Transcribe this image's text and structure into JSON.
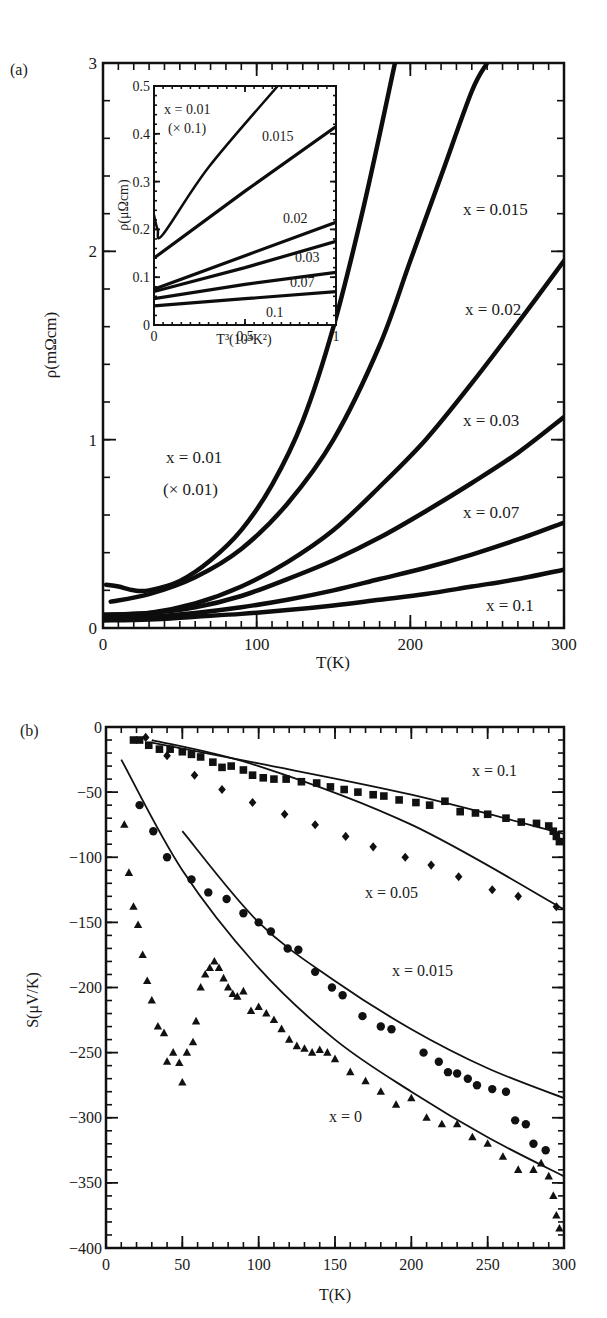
{
  "chart_data": [
    {
      "panel": "(a)",
      "type": "line",
      "title": "",
      "xlabel": "T(K)",
      "ylabel": "ρ(mΩcm)",
      "xlim": [
        0,
        300
      ],
      "ylim": [
        0,
        3
      ],
      "xticks": [
        0,
        100,
        200,
        300
      ],
      "yticks": [
        0,
        1,
        2,
        3
      ],
      "grid": false,
      "legend": "inline labels",
      "series": [
        {
          "name": "x=0.01 (× 0.01)",
          "x": [
            2,
            10,
            20,
            30,
            50,
            70,
            90,
            110,
            130,
            150,
            170,
            190
          ],
          "values": [
            0.23,
            0.22,
            0.2,
            0.2,
            0.25,
            0.36,
            0.52,
            0.76,
            1.1,
            1.6,
            2.25,
            3.0
          ]
        },
        {
          "name": "x=0.015",
          "x": [
            5,
            30,
            60,
            90,
            120,
            150,
            180,
            200,
            220,
            240,
            250
          ],
          "values": [
            0.14,
            0.18,
            0.27,
            0.42,
            0.66,
            1.0,
            1.5,
            1.95,
            2.4,
            2.85,
            3.0
          ]
        },
        {
          "name": "x=0.02",
          "x": [
            0,
            30,
            60,
            90,
            120,
            150,
            180,
            210,
            240,
            270,
            300
          ],
          "values": [
            0.07,
            0.08,
            0.13,
            0.22,
            0.35,
            0.52,
            0.75,
            1.0,
            1.3,
            1.62,
            1.95
          ]
        },
        {
          "name": "x=0.03",
          "x": [
            0,
            30,
            60,
            90,
            120,
            150,
            180,
            210,
            240,
            270,
            300
          ],
          "values": [
            0.07,
            0.08,
            0.11,
            0.17,
            0.26,
            0.36,
            0.48,
            0.62,
            0.77,
            0.93,
            1.12
          ]
        },
        {
          "name": "x=0.07",
          "x": [
            0,
            30,
            60,
            90,
            120,
            150,
            180,
            210,
            240,
            270,
            300
          ],
          "values": [
            0.05,
            0.06,
            0.08,
            0.11,
            0.15,
            0.2,
            0.26,
            0.32,
            0.39,
            0.47,
            0.56
          ]
        },
        {
          "name": "x=0.1",
          "x": [
            0,
            30,
            60,
            90,
            120,
            150,
            180,
            210,
            240,
            270,
            300
          ],
          "values": [
            0.04,
            0.045,
            0.06,
            0.075,
            0.095,
            0.12,
            0.15,
            0.18,
            0.22,
            0.26,
            0.31
          ]
        }
      ],
      "annotations": [
        "x=0.015",
        "x=0.02",
        "x=0.03",
        "x=0.07",
        "x=0.1",
        "x=0.01",
        "(× 0.01)"
      ],
      "inset": {
        "type": "line",
        "xlabel": "T³(10⁴K²)",
        "ylabel": "ρ(μΩcm)",
        "xlim": [
          0,
          1
        ],
        "ylim": [
          0,
          0.5
        ],
        "xticks": [
          0,
          0.5,
          1
        ],
        "yticks": [
          0,
          0.1,
          0.2,
          0.3,
          0.4,
          0.5
        ],
        "series": [
          {
            "name": "x=0.01 (× 0.1)",
            "x": [
              0,
              0.02,
              0.05,
              0.3,
              0.68
            ],
            "values": [
              0.23,
              0.2,
              0.19,
              0.33,
              0.5
            ]
          },
          {
            "name": "0.015",
            "x": [
              0,
              0.5,
              1
            ],
            "values": [
              0.14,
              0.28,
              0.415
            ]
          },
          {
            "name": "0.02",
            "x": [
              0,
              0.5,
              1
            ],
            "values": [
              0.075,
              0.145,
              0.215
            ]
          },
          {
            "name": "0.03",
            "x": [
              0,
              0.5,
              1
            ],
            "values": [
              0.07,
              0.12,
              0.175
            ]
          },
          {
            "name": "0.07",
            "x": [
              0,
              0.5,
              1
            ],
            "values": [
              0.055,
              0.085,
              0.11
            ]
          },
          {
            "name": "0.1",
            "x": [
              0,
              0.5,
              1
            ],
            "values": [
              0.04,
              0.055,
              0.07
            ]
          }
        ],
        "annotations": [
          "x=0.01",
          "(× 0.1)",
          "0.015",
          "0.02",
          "0.03",
          "0.07",
          "0.1"
        ]
      }
    },
    {
      "panel": "(b)",
      "type": "scatter",
      "title": "",
      "xlabel": "T(K)",
      "ylabel": "S(μV/K)",
      "xlim": [
        0,
        300
      ],
      "ylim": [
        -400,
        0
      ],
      "xticks": [
        0,
        50,
        100,
        150,
        200,
        250,
        300
      ],
      "yticks": [
        0,
        -50,
        -100,
        -150,
        -200,
        -250,
        -300,
        -350,
        -400
      ],
      "grid": false,
      "legend": "inline labels",
      "series": [
        {
          "name": "x=0.1",
          "marker": "square",
          "x": [
            18,
            22,
            28,
            35,
            42,
            50,
            56,
            62,
            70,
            76,
            82,
            90,
            96,
            103,
            110,
            118,
            128,
            138,
            147,
            156,
            165,
            175,
            182,
            192,
            203,
            212,
            222,
            232,
            242,
            250,
            262,
            272,
            282,
            290,
            293,
            295,
            297
          ],
          "values": [
            -10,
            -10,
            -14,
            -17,
            -17,
            -19,
            -21,
            -23,
            -27,
            -31,
            -30,
            -33,
            -37,
            -39,
            -40,
            -40,
            -42,
            -43,
            -46,
            -48,
            -50,
            -52,
            -53,
            -56,
            -58,
            -60,
            -57,
            -65,
            -66,
            -67,
            -70,
            -73,
            -74,
            -76,
            -80,
            -84,
            -88
          ]
        },
        {
          "name": "x=0.05",
          "marker": "diamond",
          "fit_x": [
            30,
            100,
            200,
            300
          ],
          "fit_values": [
            -10,
            -30,
            -75,
            -140
          ],
          "x": [
            26,
            40,
            58,
            76,
            96,
            117,
            137,
            157,
            175,
            196,
            213,
            231,
            253,
            270,
            295
          ],
          "values": [
            -8,
            -22,
            -37,
            -48,
            -58,
            -67,
            -75,
            -84,
            -92,
            -100,
            -106,
            -115,
            -125,
            -130,
            -138
          ]
        },
        {
          "name": "x=0.015",
          "marker": "circle",
          "fit_x": [
            50,
            100,
            150,
            200,
            250,
            300
          ],
          "fit_values": [
            -80,
            -150,
            -195,
            -232,
            -262,
            -285
          ],
          "x": [
            22,
            31,
            40,
            56,
            67,
            79,
            90,
            100,
            108,
            119,
            126,
            137,
            148,
            155,
            168,
            180,
            187,
            208,
            218,
            224,
            230,
            237,
            243,
            253,
            262,
            268,
            275,
            280,
            288
          ],
          "values": [
            -60,
            -80,
            -100,
            -117,
            -127,
            -132,
            -143,
            -150,
            -157,
            -170,
            -171,
            -188,
            -200,
            -206,
            -222,
            -230,
            -232,
            -250,
            -257,
            -265,
            -266,
            -270,
            -275,
            -278,
            -280,
            -302,
            -305,
            -320,
            -325
          ]
        },
        {
          "name": "x=0",
          "marker": "triangle",
          "fit_x": [
            10,
            50,
            100,
            150,
            200,
            250,
            300
          ],
          "fit_values": [
            -25,
            -110,
            -185,
            -240,
            -280,
            -315,
            -345
          ],
          "x": [
            12,
            15,
            18,
            21,
            24,
            27,
            30,
            34,
            38,
            40,
            44,
            48,
            50,
            53,
            57,
            59,
            62,
            65,
            68,
            71,
            74,
            77,
            80,
            83,
            86,
            90,
            95,
            100,
            105,
            110,
            115,
            120,
            125,
            130,
            135,
            140,
            145,
            150,
            160,
            170,
            180,
            190,
            200,
            210,
            220,
            230,
            240,
            250,
            260,
            270,
            280,
            285,
            290,
            293,
            295,
            297
          ],
          "values": [
            -75,
            -112,
            -138,
            -152,
            -175,
            -195,
            -210,
            -230,
            -235,
            -257,
            -250,
            -258,
            -273,
            -250,
            -242,
            -226,
            -200,
            -190,
            -185,
            -180,
            -185,
            -193,
            -200,
            -205,
            -207,
            -203,
            -218,
            -215,
            -220,
            -225,
            -232,
            -240,
            -245,
            -247,
            -250,
            -248,
            -250,
            -255,
            -265,
            -272,
            -280,
            -290,
            -285,
            -300,
            -305,
            -305,
            -315,
            -320,
            -330,
            -340,
            -340,
            -335,
            -345,
            -360,
            -375,
            -385
          ]
        }
      ],
      "annotations": [
        "x=0.1",
        "x=0.05",
        "x=0.015",
        "x=0"
      ]
    }
  ],
  "labels": {
    "panel_a": "(a)",
    "panel_b": "(b)"
  }
}
